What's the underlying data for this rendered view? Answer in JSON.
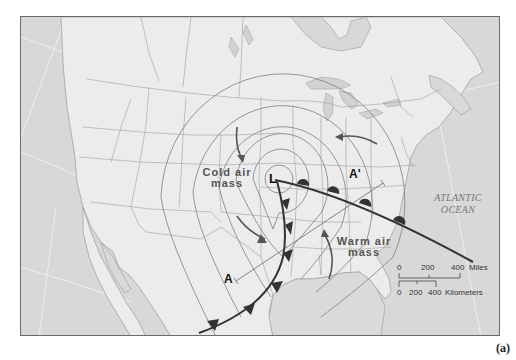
{
  "figure": {
    "caption": "(a)",
    "type": "weather map of a mid-latitude cyclone over North America"
  },
  "map": {
    "low_pressure_symbol": "L",
    "labels": {
      "cold_air_line1": "Cold air",
      "cold_air_line2": "mass",
      "warm_air_line1": "Warm air",
      "warm_air_line2": "mass",
      "ocean_line1": "ATLANTIC",
      "ocean_line2": "OCEAN"
    },
    "cross_section": {
      "start_label": "A",
      "end_label": "A'"
    },
    "fronts": [
      {
        "type": "warm front",
        "symbol": "semicircles",
        "direction": "east-southeast from L"
      },
      {
        "type": "cold front",
        "symbol": "triangles",
        "direction": "south-southwest from L"
      }
    ],
    "airflow_arrows": [
      "cold air moving south",
      "cold air moving southeast",
      "warm air moving north",
      "air moving west toward the low"
    ],
    "isobars": "concentric ovals centered on low"
  },
  "scale_bar": {
    "miles": {
      "ticks": [
        "0",
        "200",
        "400"
      ],
      "unit": "Miles"
    },
    "kilometers": {
      "ticks": [
        "0",
        "200",
        "400"
      ],
      "unit": "Kilometers"
    }
  },
  "colors": {
    "land": "#ececec",
    "ocean": "#d9d9d9",
    "border": "#9a9a9a",
    "isobar": "#8a8a8a",
    "front": "#3a3a3a",
    "arrow": "#555555"
  }
}
